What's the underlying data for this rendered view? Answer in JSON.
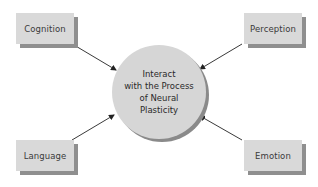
{
  "diagram": {
    "center": {
      "lines": [
        "Interact",
        "with the Process",
        "of Neural",
        "Plasticity"
      ]
    },
    "nodes": {
      "top_left": "Cognition",
      "top_right": "Perception",
      "bottom_left": "Language",
      "bottom_right": "Emotion"
    },
    "edges": [
      {
        "from": "Cognition",
        "to": "center"
      },
      {
        "from": "Perception",
        "to": "center"
      },
      {
        "from": "Language",
        "to": "center"
      },
      {
        "from": "Emotion",
        "to": "center"
      }
    ],
    "colors": {
      "box_fill": "#d9d9d9",
      "box_shadow": "#8f8f8f",
      "circle_fill": "#d6d6d6",
      "circle_shadow": "#8a8a8a",
      "arrow": "#222222",
      "text": "#3a3a3a"
    }
  }
}
